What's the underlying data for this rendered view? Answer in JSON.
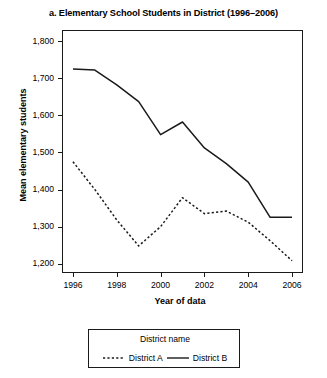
{
  "chart_data": {
    "type": "line",
    "title": "a. Elementary School Students in District (1996–2006)",
    "xlabel": "Year of data",
    "ylabel": "Mean elementary students",
    "x": [
      1996,
      1997,
      1998,
      1999,
      2000,
      2001,
      2002,
      2003,
      2004,
      2005,
      2006
    ],
    "xlim": [
      1995.5,
      2006.5
    ],
    "ylim": [
      1175,
      1830
    ],
    "xticks": [
      1996,
      1998,
      2000,
      2002,
      2004,
      2006
    ],
    "xtick_labels": [
      "1996",
      "1998",
      "2000",
      "2002",
      "2004",
      "2006"
    ],
    "yticks": [
      1200,
      1300,
      1400,
      1500,
      1600,
      1700,
      1800
    ],
    "ytick_labels": [
      "1,200",
      "1,300",
      "1,400",
      "1,500",
      "1,600",
      "1,700",
      "1,800"
    ],
    "grid": false,
    "legend_position": "below",
    "legend_title": "District name",
    "series": [
      {
        "name": "District  A",
        "style": "dashed",
        "color": "#1a1a1a",
        "values": [
          1475,
          1400,
          1318,
          1248,
          1300,
          1378,
          1335,
          1342,
          1312,
          1262,
          1208
        ]
      },
      {
        "name": "District  B",
        "style": "solid",
        "color": "#1a1a1a",
        "values": [
          1725,
          1722,
          1682,
          1637,
          1548,
          1582,
          1512,
          1470,
          1420,
          1325,
          1325
        ]
      }
    ]
  }
}
